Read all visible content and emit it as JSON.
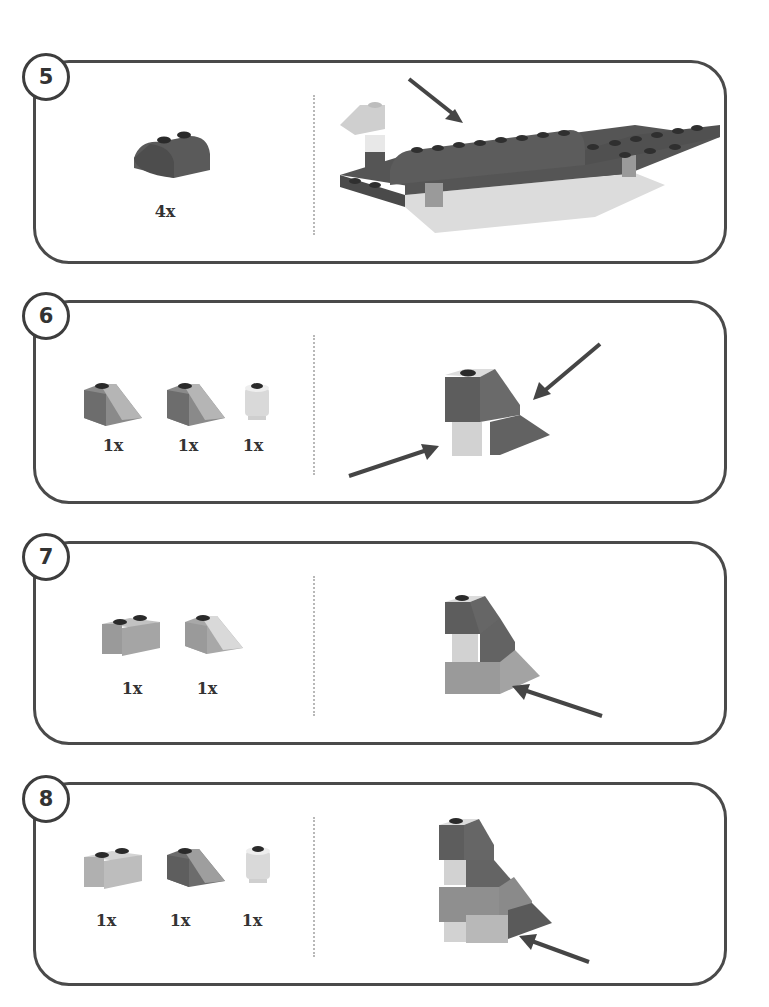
{
  "steps": [
    {
      "number": "5",
      "parts": [
        {
          "name": "curved-slope-2x2-dark",
          "qty": "4x"
        }
      ],
      "assembly": "boat-hull-with-curved-top",
      "arrows": 1
    },
    {
      "number": "6",
      "parts": [
        {
          "name": "slope-1x2-dark",
          "qty": "1x"
        },
        {
          "name": "slope-1x2-dark",
          "qty": "1x"
        },
        {
          "name": "round-brick-1x1-light",
          "qty": "1x"
        }
      ],
      "assembly": "slope-on-round-brick",
      "arrows": 2
    },
    {
      "number": "7",
      "parts": [
        {
          "name": "brick-1x2-medium",
          "qty": "1x"
        },
        {
          "name": "slope-1x2-medium",
          "qty": "1x"
        }
      ],
      "assembly": "tower-layer-2",
      "arrows": 1
    },
    {
      "number": "8",
      "parts": [
        {
          "name": "brick-1x2-light",
          "qty": "1x"
        },
        {
          "name": "slope-1x2-dark",
          "qty": "1x"
        },
        {
          "name": "round-brick-1x1-light",
          "qty": "1x"
        }
      ],
      "assembly": "tower-layer-3",
      "arrows": 1
    }
  ],
  "colors": {
    "border": "#4a4a4a",
    "dark_brick": "#5a5a5a",
    "medium_brick": "#8c8c8c",
    "light_brick": "#c4c4c4",
    "white_brick": "#e2e2e2",
    "arrow": "#454545"
  }
}
